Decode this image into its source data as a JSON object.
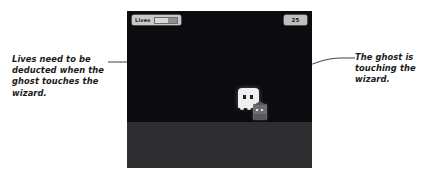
{
  "scene": {
    "type": "game-screenshot-with-annotations",
    "canvas_background": "#0c0b10",
    "ground_color": "#2e2e30"
  },
  "hud": {
    "lives": {
      "label": "Lives",
      "bar_fill_percent": 62
    },
    "score": {
      "value": "25"
    }
  },
  "sprites": {
    "ghost": {
      "name": "ghost",
      "color": "#efefef"
    },
    "wizard": {
      "name": "wizard",
      "color": "#6e6e72"
    }
  },
  "annotations": [
    {
      "id": "left",
      "text": "Lives need to be deducted when the ghost touches the wizard.",
      "points_to": "lives-hud"
    },
    {
      "id": "right",
      "text": "The ghost is touching the wizard.",
      "points_to": "ghost-sprite"
    }
  ]
}
